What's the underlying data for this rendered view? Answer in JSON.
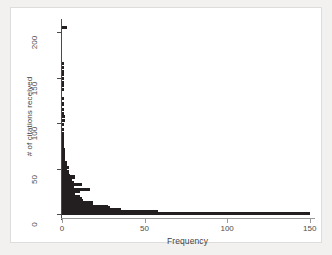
{
  "chart_data": {
    "type": "bar",
    "orientation": "horizontal",
    "title": "",
    "xlabel": "Frequency",
    "ylabel": "# of citations received",
    "xlim": [
      0,
      152
    ],
    "ylim": [
      -4,
      212
    ],
    "xticks": [
      0,
      50,
      100,
      150
    ],
    "yticks": [
      0,
      50,
      100,
      150,
      200
    ],
    "xtick_labels": [
      "0",
      "50",
      "100",
      "150"
    ],
    "ytick_labels": [
      "0",
      "50",
      "100",
      "150",
      "200"
    ],
    "grid": false,
    "legend": false,
    "bar_color": "#231f20",
    "categories": [
      1,
      3,
      5,
      7,
      9,
      11,
      13,
      15,
      17,
      19,
      21,
      23,
      25,
      27,
      29,
      31,
      33,
      35,
      37,
      39,
      41,
      43,
      45,
      47,
      49,
      51,
      53,
      55,
      57,
      59,
      61,
      63,
      65,
      67,
      69,
      71,
      73,
      75,
      77,
      79,
      81,
      83,
      85,
      87,
      89,
      93,
      99,
      103,
      107,
      111,
      115,
      121,
      127,
      137,
      141,
      145,
      149,
      153,
      157,
      161,
      165,
      205
    ],
    "values": [
      150,
      58,
      36,
      29,
      28,
      19,
      19,
      13,
      12,
      11,
      8,
      8,
      11,
      17,
      7,
      6,
      12,
      7,
      6,
      5,
      8,
      5,
      4,
      4,
      3,
      4,
      3,
      3,
      3,
      2,
      2,
      2,
      2,
      2,
      2,
      2,
      1,
      1,
      1,
      1,
      1,
      1,
      1,
      1,
      1,
      1,
      1,
      2,
      2,
      1,
      1,
      1,
      1,
      1,
      1,
      1,
      1,
      1,
      1,
      1,
      1,
      3
    ],
    "note": "Highly right-skewed distribution of citation counts; most papers receive few citations (frequency ~150 at the lowest bin), with a long thin tail extending to ~205 citations."
  },
  "axes": {
    "xlabel": "Frequency",
    "ylabel": "# of citations received"
  }
}
